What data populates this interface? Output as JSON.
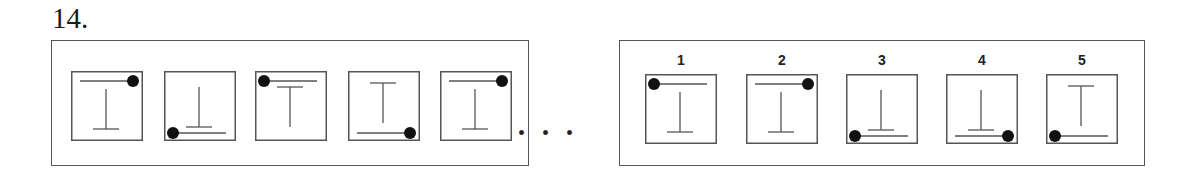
{
  "question": {
    "number_label": "14."
  },
  "sequence": {
    "ellipsis": "• • •",
    "figures": [
      {
        "line": "top",
        "dot": "right",
        "t": "inverted"
      },
      {
        "line": "bottom",
        "dot": "left",
        "t": "inverted"
      },
      {
        "line": "top",
        "dot": "left",
        "t": "upright"
      },
      {
        "line": "bottom",
        "dot": "right",
        "t": "upright"
      },
      {
        "line": "top",
        "dot": "right",
        "t": "inverted"
      }
    ]
  },
  "options": {
    "items": [
      {
        "label": "1",
        "line": "top",
        "dot": "left",
        "t": "inverted"
      },
      {
        "label": "2",
        "line": "top",
        "dot": "right",
        "t": "inverted"
      },
      {
        "label": "3",
        "line": "bottom",
        "dot": "left",
        "t": "inverted"
      },
      {
        "label": "4",
        "line": "bottom",
        "dot": "right",
        "t": "inverted"
      },
      {
        "label": "5",
        "line": "bottom",
        "dot": "left",
        "t": "upright"
      }
    ]
  },
  "colors": {
    "stroke": "#555555",
    "dot": "#111111",
    "frame": "#555555"
  }
}
